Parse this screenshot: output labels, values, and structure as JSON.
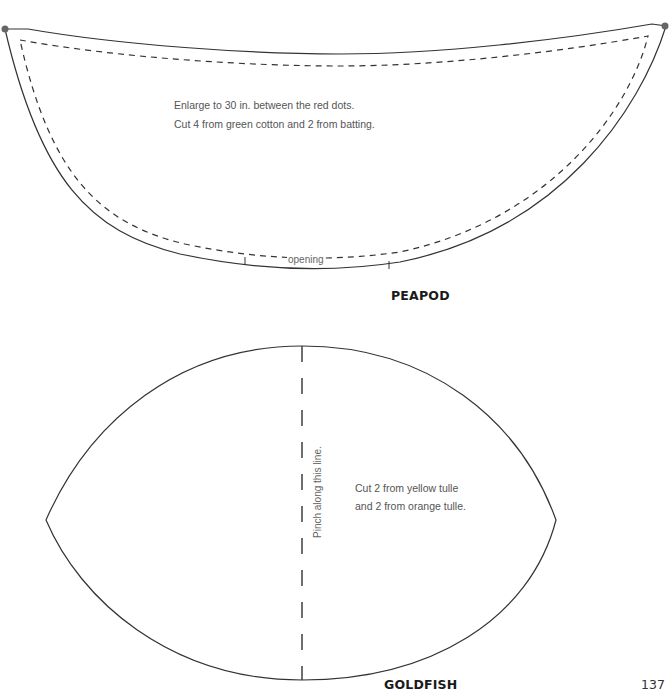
{
  "page": {
    "number": "137"
  },
  "peapod": {
    "title": "PEAPOD",
    "instructions": [
      "Enlarge to 30 in. between the red dots.",
      "Cut 4 from green cotton and 2 from batting."
    ],
    "opening_label": "opening",
    "marker_dot_color": "#666666",
    "line_color": "#333333"
  },
  "goldfish": {
    "title": "GOLDFISH",
    "instructions": [
      "Cut 2 from yellow tulle",
      "and 2 from orange tulle."
    ],
    "fold_label": "Pinch along this line.",
    "line_color": "#333333"
  }
}
